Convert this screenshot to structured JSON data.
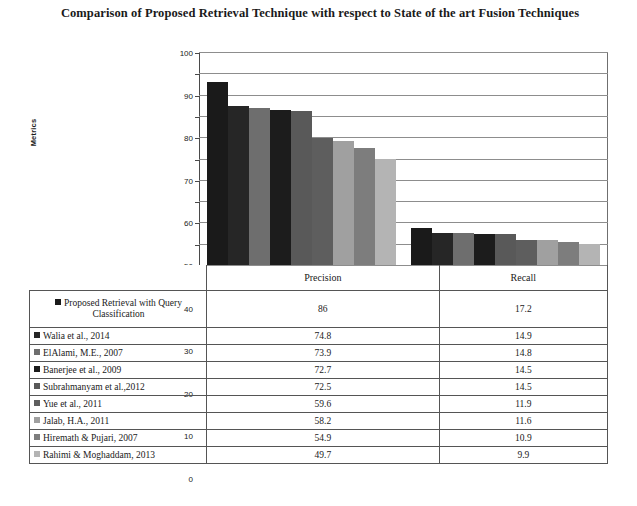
{
  "chart_data": {
    "type": "bar",
    "title": "Comparison of Proposed Retrieval Technique with respect to State of the art Fusion Techniques",
    "xlabel": "",
    "ylabel": "Metrics",
    "ylim": [
      0,
      100
    ],
    "yticks": [
      0,
      10,
      20,
      30,
      40,
      50,
      60,
      70,
      80,
      90,
      100
    ],
    "grid": true,
    "legend_position": "data-table-below",
    "categories": [
      "Precision",
      "Recall"
    ],
    "series": [
      {
        "name": "Proposed Retrieval with Query Classification",
        "values": [
          86,
          17.2
        ],
        "color": "#1a1a1a"
      },
      {
        "name": "Walia et al., 2014",
        "values": [
          74.8,
          14.9
        ],
        "color": "#262626"
      },
      {
        "name": "ElAlami, M.E., 2007",
        "values": [
          73.9,
          14.8
        ],
        "color": "#6e6e6e"
      },
      {
        "name": "Banerjee et al., 2009",
        "values": [
          72.7,
          14.5
        ],
        "color": "#1c1c1c"
      },
      {
        "name": "Subrahmanyam et al.,2012",
        "values": [
          72.5,
          14.5
        ],
        "color": "#595959"
      },
      {
        "name": "Yue et al., 2011",
        "values": [
          59.6,
          11.9
        ],
        "color": "#5e5e5e"
      },
      {
        "name": "Jalab, H.A., 2011",
        "values": [
          58.2,
          11.6
        ],
        "color": "#a0a0a0"
      },
      {
        "name": "Hiremath & Pujari, 2007",
        "values": [
          54.9,
          10.9
        ],
        "color": "#7d7d7d"
      },
      {
        "name": "Rahimi & Moghaddam, 2013",
        "values": [
          49.7,
          9.9
        ],
        "color": "#b4b4b4"
      }
    ]
  },
  "table": {
    "header": {
      "legend_label": "",
      "columns": [
        "Precision",
        "Recall"
      ]
    },
    "rows": [
      {
        "label": "Proposed Retrieval with Query Classification",
        "precision": "86",
        "recall": "17.2"
      },
      {
        "label": "Walia et al., 2014",
        "precision": "74.8",
        "recall": "14.9"
      },
      {
        "label": "ElAlami, M.E., 2007",
        "precision": "73.9",
        "recall": "14.8"
      },
      {
        "label": "Banerjee et al., 2009",
        "precision": "72.7",
        "recall": "14.5"
      },
      {
        "label": "Subrahmanyam et al.,2012",
        "precision": "72.5",
        "recall": "14.5"
      },
      {
        "label": "Yue et al., 2011",
        "precision": "59.6",
        "recall": "11.9"
      },
      {
        "label": "Jalab, H.A., 2011",
        "precision": "58.2",
        "recall": "11.6"
      },
      {
        "label": "Hiremath & Pujari, 2007",
        "precision": "54.9",
        "recall": "10.9"
      },
      {
        "label": "Rahimi & Moghaddam, 2013",
        "precision": "49.7",
        "recall": "9.9"
      }
    ]
  }
}
